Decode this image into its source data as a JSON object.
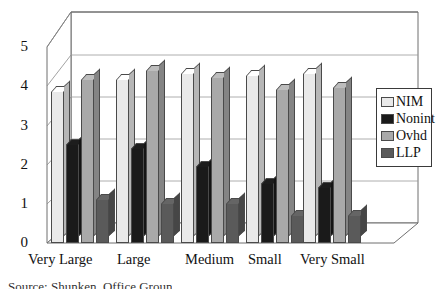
{
  "chart_data": {
    "type": "bar",
    "title": "",
    "subtitle": "",
    "xlabel": "",
    "ylabel": "",
    "ylim": [
      0,
      5
    ],
    "yticks": [
      "0",
      "1",
      "2",
      "3",
      "4",
      "5"
    ],
    "grid": true,
    "style": "3d-clustered-column",
    "legend_position": "right",
    "categories": [
      "Very Large",
      "Large",
      "Medium",
      "Small",
      "Very Small"
    ],
    "series": [
      {
        "name": "NIM",
        "color": "#e9e9e9",
        "values": [
          3.85,
          4.15,
          4.3,
          4.25,
          4.3
        ]
      },
      {
        "name": "Nonint",
        "color": "#1a1a1a",
        "values": [
          2.5,
          2.4,
          1.95,
          1.5,
          1.4
        ]
      },
      {
        "name": "Ovhd",
        "color": "#a9a9a9",
        "values": [
          4.15,
          4.4,
          4.2,
          3.9,
          3.95
        ]
      },
      {
        "name": "LLP",
        "color": "#5a5a5a",
        "values": [
          1.1,
          1.0,
          1.0,
          0.7,
          0.7
        ]
      }
    ]
  },
  "legend": {
    "items": [
      {
        "label": "NIM"
      },
      {
        "label": "Nonint"
      },
      {
        "label": "Ovhd"
      },
      {
        "label": "LLP"
      }
    ]
  },
  "caption": {
    "text": "Source: Shunken, Office Groun"
  }
}
